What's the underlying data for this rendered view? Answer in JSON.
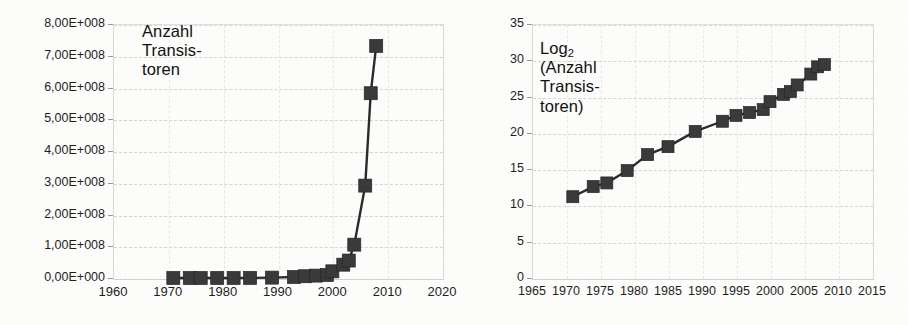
{
  "chart_data": [
    {
      "id": "transistors-linear",
      "type": "line",
      "title": "Anzahl\nTransis-\ntoren",
      "xlabel": "",
      "ylabel": "Anzahl Transistoren",
      "xlim": [
        1960,
        2020
      ],
      "ylim": [
        0,
        800000000
      ],
      "grid": true,
      "legend": "none",
      "marker": "square",
      "series_color": "#3a3a3a",
      "xticks": [
        "1960",
        "1970",
        "1980",
        "1990",
        "2000",
        "2010",
        "2020"
      ],
      "xtick_values": [
        1960,
        1970,
        1980,
        1990,
        2000,
        2010,
        2020
      ],
      "yticks": [
        "0,00E+000",
        "1,00E+008",
        "2,00E+008",
        "3,00E+008",
        "4,00E+008",
        "5,00E+008",
        "6,00E+008",
        "7,00E+008",
        "8,00E+008"
      ],
      "ytick_values": [
        0,
        100000000,
        200000000,
        300000000,
        400000000,
        500000000,
        600000000,
        700000000,
        800000000
      ],
      "x": [
        1971,
        1974,
        1976,
        1979,
        1982,
        1985,
        1989,
        1993,
        1995,
        1997,
        1999,
        2000,
        2002,
        2003,
        2004,
        2006,
        2007
      ],
      "values": [
        2300,
        6000,
        8500,
        29000,
        134000,
        275000,
        1180000,
        3100000,
        5500000,
        7500000,
        9500000,
        21000000,
        42000000,
        55000000,
        105000000,
        291000000,
        582000000
      ],
      "points": [
        {
          "x": 1971,
          "y": 2300
        },
        {
          "x": 1974,
          "y": 6000
        },
        {
          "x": 1976,
          "y": 8500
        },
        {
          "x": 1979,
          "y": 29000
        },
        {
          "x": 1982,
          "y": 134000
        },
        {
          "x": 1985,
          "y": 275000
        },
        {
          "x": 1989,
          "y": 1180000
        },
        {
          "x": 1993,
          "y": 3100000
        },
        {
          "x": 1995,
          "y": 5500000
        },
        {
          "x": 1997,
          "y": 7500000
        },
        {
          "x": 1999,
          "y": 9500000
        },
        {
          "x": 2000,
          "y": 21000000
        },
        {
          "x": 2002,
          "y": 42000000
        },
        {
          "x": 2003,
          "y": 55000000
        },
        {
          "x": 2004,
          "y": 105000000
        },
        {
          "x": 2006,
          "y": 291000000
        },
        {
          "x": 2007,
          "y": 582000000
        },
        {
          "x": 2008,
          "y": 731000000
        }
      ]
    },
    {
      "id": "transistors-log2",
      "type": "line",
      "title": "Log₂\n(Anzahl\nTransis-\ntoren)",
      "title_main": "Log",
      "title_sub": "2",
      "title_rest": "(Anzahl\nTransis-\ntoren)",
      "xlabel": "",
      "ylabel": "Log2 (Anzahl Transistoren)",
      "xlim": [
        1965,
        2015
      ],
      "ylim": [
        0,
        35
      ],
      "grid": true,
      "legend": "none",
      "marker": "square",
      "series_color": "#3a3a3a",
      "xticks": [
        "1965",
        "1970",
        "1975",
        "1980",
        "1985",
        "1990",
        "1995",
        "2000",
        "2005",
        "2010",
        "2015"
      ],
      "xtick_values": [
        1965,
        1970,
        1975,
        1980,
        1985,
        1990,
        1995,
        2000,
        2005,
        2010,
        2015
      ],
      "yticks": [
        "0",
        "5",
        "10",
        "15",
        "20",
        "25",
        "30",
        "35"
      ],
      "ytick_values": [
        0,
        5,
        10,
        15,
        20,
        25,
        30,
        35
      ],
      "x": [
        1971,
        1974,
        1976,
        1979,
        1982,
        1985,
        1989,
        1993,
        1995,
        1997,
        1999,
        2000,
        2002,
        2003,
        2004,
        2006,
        2007,
        2008
      ],
      "values": [
        11.2,
        12.6,
        13.1,
        14.8,
        17.0,
        18.1,
        20.2,
        21.6,
        22.4,
        22.8,
        23.2,
        24.3,
        25.3,
        25.7,
        26.6,
        28.1,
        29.1,
        29.4
      ],
      "points": [
        {
          "x": 1971,
          "y": 11.2
        },
        {
          "x": 1974,
          "y": 12.6
        },
        {
          "x": 1976,
          "y": 13.1
        },
        {
          "x": 1979,
          "y": 14.8
        },
        {
          "x": 1982,
          "y": 17.0
        },
        {
          "x": 1985,
          "y": 18.1
        },
        {
          "x": 1989,
          "y": 20.2
        },
        {
          "x": 1993,
          "y": 21.6
        },
        {
          "x": 1995,
          "y": 22.4
        },
        {
          "x": 1997,
          "y": 22.8
        },
        {
          "x": 1999,
          "y": 23.2
        },
        {
          "x": 2000,
          "y": 24.3
        },
        {
          "x": 2002,
          "y": 25.3
        },
        {
          "x": 2003,
          "y": 25.7
        },
        {
          "x": 2004,
          "y": 26.6
        },
        {
          "x": 2006,
          "y": 28.1
        },
        {
          "x": 2007,
          "y": 29.1
        },
        {
          "x": 2008,
          "y": 29.4
        }
      ]
    }
  ],
  "colors": {
    "marker": "#3a3a3a",
    "line": "#2b2b2b",
    "grid": "#cfcfcb",
    "text": "#1d1d1d",
    "background": "#fdfdfc"
  }
}
